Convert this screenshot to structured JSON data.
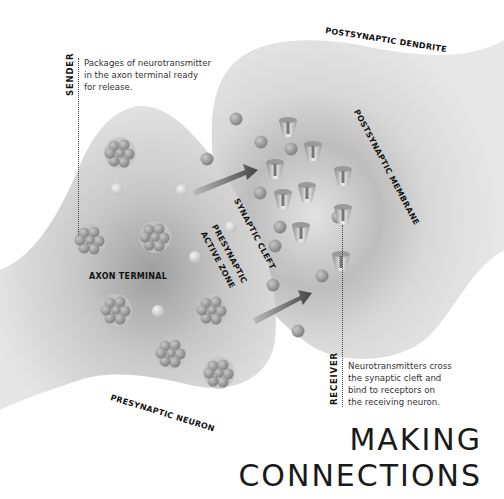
{
  "title": {
    "line1": "MAKING",
    "line2": "CONNECTIONS"
  },
  "labels": {
    "postsynaptic_dendrite": "POSTSYNAPTIC DENDRITE",
    "postsynaptic_membrane": "POSTSYNAPTIC MEMBRANE",
    "synaptic_cleft": "SYNAPTIC CLEFT",
    "presynaptic_active_zone_1": "PRESYNAPTIC",
    "presynaptic_active_zone_2": "ACTIVE ZONE",
    "axon_terminal": "AXON TERMINAL",
    "presynaptic_neuron": "PRESYNAPTIC NEURON"
  },
  "sender": {
    "label": "SENDER",
    "lines": [
      "Packages of neurotransmitter",
      "in the axon terminal ready",
      "for release."
    ]
  },
  "receiver": {
    "label": "RECEIVER",
    "lines": [
      "Neurotransmitters cross",
      "the synaptic cleft and",
      "bind to receptors on",
      "the receiving neuron."
    ]
  },
  "colors": {
    "membrane": "#d9d9d9",
    "vesicle": "#9a9a9a",
    "arrow": "#555555",
    "text": "#111111"
  }
}
